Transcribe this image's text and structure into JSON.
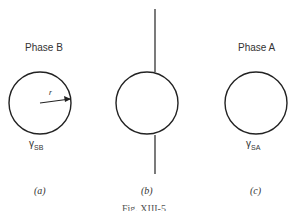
{
  "panels": [
    {
      "id": "a",
      "title": "Phase B",
      "gamma_label": "γ",
      "gamma_sub": "SB",
      "radius_label": "r",
      "caption": "(a)"
    },
    {
      "id": "b",
      "title": "",
      "caption": "(b)"
    },
    {
      "id": "c",
      "title": "Phase A",
      "gamma_label": "γ",
      "gamma_sub": "SA",
      "caption": "(c)"
    }
  ],
  "figure_caption": "Fig. XIII-5"
}
